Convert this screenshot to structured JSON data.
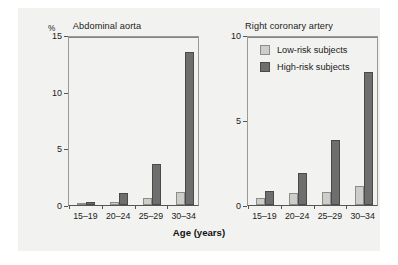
{
  "chart_data": {
    "type": "bar",
    "title": "",
    "xlabel": "Age (years)",
    "ylabel": "%",
    "grid": true,
    "legend_position": "inside top-left of right panel",
    "categories": [
      "15–19",
      "20–24",
      "25–29",
      "30–34"
    ],
    "legend": [
      "Low-risk subjects",
      "High-risk subjects"
    ],
    "panels": [
      {
        "title": "Abdominal aorta",
        "ylim": [
          0,
          15
        ],
        "yticks": [
          0,
          5,
          10,
          15
        ],
        "ytick_labels": [
          "0",
          "5",
          "10",
          "15"
        ],
        "gridline_values": [
          5,
          10
        ],
        "series": [
          {
            "name": "Low-risk subjects",
            "values": [
              0.1,
              0.25,
              0.6,
              1.15
            ]
          },
          {
            "name": "High-risk subjects",
            "values": [
              0.3,
              1.05,
              3.6,
              13.5
            ]
          }
        ]
      },
      {
        "title": "Right coronary artery",
        "ylim": [
          0,
          10
        ],
        "yticks": [
          0,
          5,
          10
        ],
        "ytick_labels": [
          "0",
          "5",
          "10"
        ],
        "gridline_values": [
          5
        ],
        "series": [
          {
            "name": "Low-risk subjects",
            "values": [
              0.4,
              0.7,
              0.75,
              1.1
            ]
          },
          {
            "name": "High-risk subjects",
            "values": [
              0.8,
              1.9,
              3.85,
              7.8
            ]
          }
        ]
      }
    ]
  },
  "colors": {
    "low_risk": "#cdcdc9",
    "high_risk": "#6e6e6e",
    "background": "#f2f2f0",
    "axis": "#555551",
    "grid": "#83837f"
  },
  "axis_title": "Age (years)",
  "percent_symbol": "%"
}
